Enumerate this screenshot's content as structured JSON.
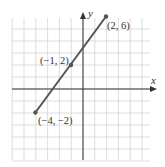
{
  "chart_data": {
    "type": "line",
    "title": "",
    "xlabel": "x",
    "ylabel": "y",
    "xlim": [
      -6,
      6
    ],
    "ylim": [
      -6,
      7
    ],
    "grid": true,
    "series": [
      {
        "name": "segment",
        "x": [
          -4,
          -1,
          2
        ],
        "y": [
          -2,
          2,
          6
        ],
        "color": "#555555"
      }
    ],
    "points": [
      {
        "x": 2,
        "y": 6,
        "label": "(2, 6)"
      },
      {
        "x": -1,
        "y": 2,
        "label": "(−1, 2)"
      },
      {
        "x": -4,
        "y": -2,
        "label": "(−4, −2)"
      }
    ],
    "annotations": [
      "(2, 6)",
      "(−1, 2)",
      "(−4, −2)"
    ]
  },
  "labels": {
    "x_axis": "x",
    "y_axis": "y",
    "p1": "(2, 6)",
    "p2": "(−1, 2)",
    "p3": "(−4, −2)"
  },
  "colors": {
    "grid": "#d4d4d4",
    "axis": "#333333",
    "line": "#555555",
    "point": "#555555"
  }
}
